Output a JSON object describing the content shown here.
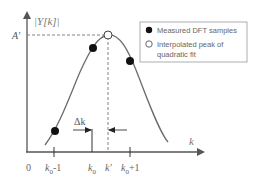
{
  "axes": {
    "y_label": "|Y[k]|",
    "x_label": "k",
    "peak_label": "A'"
  },
  "ticks": [
    {
      "label": "0",
      "sub": "",
      "suffix": ""
    },
    {
      "label": "k",
      "sub": "0",
      "suffix": "-1"
    },
    {
      "label": "k",
      "sub": "0",
      "suffix": ""
    },
    {
      "label": "k'",
      "sub": "",
      "suffix": ""
    },
    {
      "label": "k",
      "sub": "0",
      "suffix": "+1"
    }
  ],
  "annotation": {
    "delta_label": "Δk"
  },
  "legend": {
    "items": [
      {
        "marker": "filled-circle",
        "label": "Measured DFT samples"
      },
      {
        "marker": "open-circle",
        "label_line1": "Interpolated peak of",
        "label_line2": "quadratic fit"
      }
    ]
  },
  "colors": {
    "curve": "#6b6b6b",
    "axis": "#555555",
    "marker": "#111111",
    "legend_border": "#999999"
  }
}
